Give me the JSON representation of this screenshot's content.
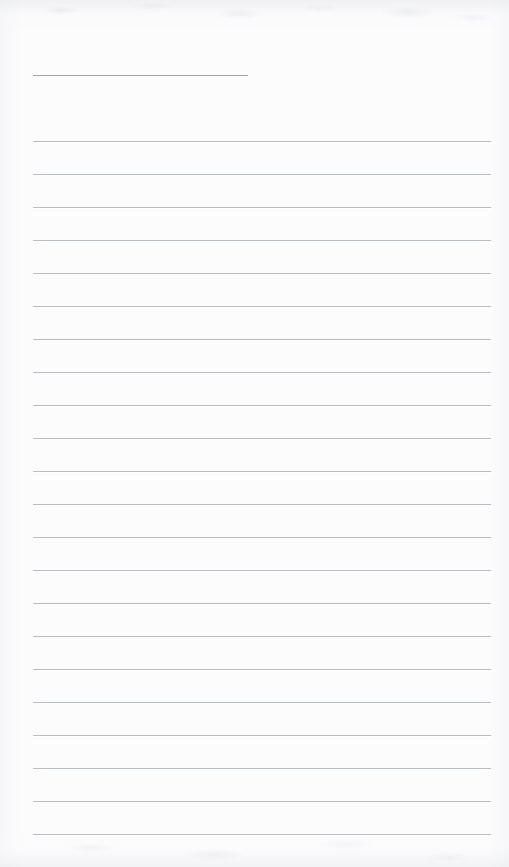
{
  "document": {
    "kind": "scanned-lined-notebook-page",
    "title_text": "",
    "body_text": "",
    "page_width": 509,
    "page_height": 867,
    "background_color": "#fcfcfd",
    "ink_color": "#b9bdc2",
    "header_rule_color": "#9fa4aa",
    "is_blank": "true",
    "visible_text_count": "0"
  },
  "layout": {
    "rule_left_x": 33,
    "rule_right_x": 491,
    "rule_width": 458,
    "first_rule_y": 141,
    "last_rule_y": 834,
    "rule_spacing": 33,
    "rule_count": 22,
    "rule_thickness": 1,
    "top_margin": 141,
    "left_margin": 33,
    "right_margin": 18,
    "bottom_margin": 33
  },
  "header_rule": {
    "name": "title-rule",
    "x": 33,
    "y": 75,
    "width": 215,
    "thickness": 1
  },
  "rules": [
    {
      "index": 1,
      "y": 141
    },
    {
      "index": 2,
      "y": 174
    },
    {
      "index": 3,
      "y": 207
    },
    {
      "index": 4,
      "y": 240
    },
    {
      "index": 5,
      "y": 273
    },
    {
      "index": 6,
      "y": 306
    },
    {
      "index": 7,
      "y": 339
    },
    {
      "index": 8,
      "y": 372
    },
    {
      "index": 9,
      "y": 405
    },
    {
      "index": 10,
      "y": 438
    },
    {
      "index": 11,
      "y": 471
    },
    {
      "index": 12,
      "y": 504
    },
    {
      "index": 13,
      "y": 537
    },
    {
      "index": 14,
      "y": 570
    },
    {
      "index": 15,
      "y": 603
    },
    {
      "index": 16,
      "y": 636
    },
    {
      "index": 17,
      "y": 669
    },
    {
      "index": 18,
      "y": 702
    },
    {
      "index": 19,
      "y": 735
    },
    {
      "index": 20,
      "y": 768
    },
    {
      "index": 21,
      "y": 801
    },
    {
      "index": 22,
      "y": 834
    }
  ]
}
